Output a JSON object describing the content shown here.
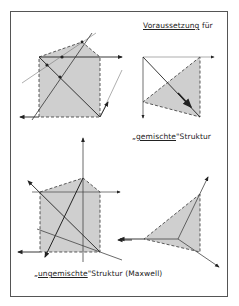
{
  "labels": {
    "heading": "Voraussetzung für",
    "heading_underlined": "Voraussetzung",
    "heading_rest": " für",
    "mixed_prefix": "„",
    "mixed_underlined": "gemischte",
    "mixed_suffix": "\"Struktur",
    "unmixed_prefix": "„",
    "unmixed_underlined": "ungemischte",
    "unmixed_suffix": "\"Struktur (Maxwell)"
  },
  "colors": {
    "fill": "#cfcfcf",
    "line": "#222222",
    "frame": "#555555",
    "thin_line": "#777777"
  },
  "figures": [
    {
      "id": "mixed-pentagon",
      "position": "upper-left"
    },
    {
      "id": "mixed-triangle",
      "position": "upper-right"
    },
    {
      "id": "unmixed-pentagon",
      "position": "lower-left"
    },
    {
      "id": "unmixed-triangle",
      "position": "lower-right"
    }
  ]
}
